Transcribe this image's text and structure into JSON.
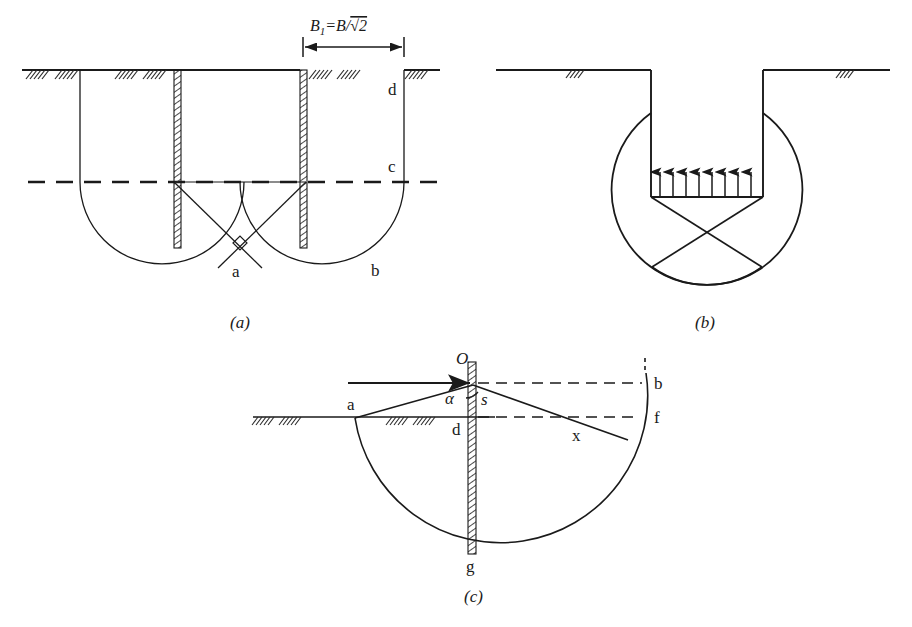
{
  "figure": {
    "background_color": "#ffffff",
    "line_color": "#1a1a1a"
  },
  "panels": [
    {
      "id": "a",
      "caption": "(a)",
      "dimension_label": {
        "main": "B",
        "subscript": "1",
        "equals": "=B/",
        "radical": "√2",
        "full_text": "B₁=B/√2"
      },
      "point_labels": [
        {
          "key": "a",
          "text": "a"
        },
        {
          "key": "b",
          "text": "b"
        },
        {
          "key": "c",
          "text": "c"
        },
        {
          "key": "d",
          "text": "d"
        }
      ],
      "elements": [
        "ground-line",
        "left-sheet-pile-wall",
        "right-sheet-pile-wall",
        "excavation-dashed-level",
        "left-failure-arc",
        "right-failure-arc",
        "slip-line-left",
        "slip-line-right",
        "right-angle-marker",
        "dimension-arrow"
      ]
    },
    {
      "id": "b",
      "caption": "(b)",
      "arrow_count": 8,
      "point_labels": [],
      "elements": [
        "ground-line-left",
        "ground-line-right",
        "trench-left-wall",
        "trench-right-wall",
        "trench-base",
        "uplift-arrows",
        "left-failure-circle",
        "right-failure-circle",
        "wedge-left",
        "wedge-right"
      ]
    },
    {
      "id": "c",
      "caption": "(c)",
      "point_labels": [
        {
          "key": "O",
          "text": "O",
          "italic": true
        },
        {
          "key": "alpha",
          "text": "α",
          "italic": true
        },
        {
          "key": "s",
          "text": "s",
          "italic": true
        },
        {
          "key": "a",
          "text": "a"
        },
        {
          "key": "d",
          "text": "d"
        },
        {
          "key": "b",
          "text": "b"
        },
        {
          "key": "f",
          "text": "f"
        },
        {
          "key": "x",
          "text": "x"
        },
        {
          "key": "g",
          "text": "g"
        }
      ],
      "elements": [
        "ground-line",
        "sheet-pile-wall",
        "slip-circle-arc",
        "force-arrow",
        "radius-line-a",
        "radius-line-x",
        "dashed-level-b",
        "dashed-level-f",
        "angle-arc-alpha"
      ]
    }
  ]
}
